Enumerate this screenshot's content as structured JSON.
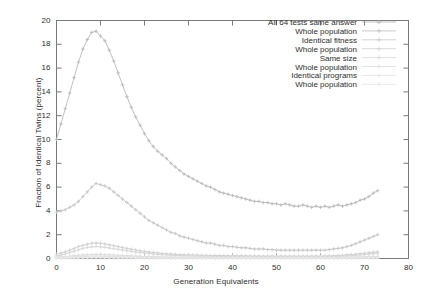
{
  "chart_data": {
    "type": "line",
    "title": "",
    "xlabel": "Generation Equivalents",
    "ylabel": "Fraction of Identical Twins (percent)",
    "xlim": [
      0,
      80
    ],
    "ylim": [
      0,
      20
    ],
    "xticks": [
      0,
      10,
      20,
      30,
      40,
      50,
      60,
      70,
      80
    ],
    "yticks": [
      0,
      2,
      4,
      6,
      8,
      10,
      12,
      14,
      16,
      18,
      20
    ],
    "grid": false,
    "legend_position": "top-right",
    "legend_entries": [
      "All 64 tests same answer",
      "Whole population",
      "Identical fitness",
      "Whole population",
      "Same size",
      "Whole population",
      "Identical programs",
      "Whole population"
    ],
    "marker": "plus-with-line",
    "series": [
      {
        "name": "All 64 tests same answer",
        "color": "#b9b9b9",
        "x": [
          0,
          1,
          2,
          3,
          4,
          5,
          6,
          7,
          8,
          9,
          10,
          11,
          12,
          13,
          14,
          15,
          16,
          17,
          18,
          19,
          20,
          21,
          22,
          23,
          24,
          25,
          26,
          27,
          28,
          29,
          30,
          31,
          32,
          33,
          34,
          35,
          36,
          37,
          38,
          39,
          40,
          41,
          42,
          43,
          44,
          45,
          46,
          47,
          48,
          49,
          50,
          51,
          52,
          53,
          54,
          55,
          56,
          57,
          58,
          59,
          60,
          61,
          62,
          63,
          64,
          65,
          66,
          67,
          68,
          69,
          70,
          71,
          72,
          73
        ],
        "values": [
          10.0,
          11.3,
          12.6,
          13.9,
          15.2,
          16.5,
          17.6,
          18.4,
          19.0,
          19.1,
          18.7,
          18.3,
          17.5,
          16.6,
          15.6,
          14.6,
          13.6,
          12.7,
          11.9,
          11.2,
          10.5,
          9.9,
          9.4,
          9.0,
          8.7,
          8.4,
          8.0,
          7.7,
          7.4,
          7.1,
          6.9,
          6.7,
          6.5,
          6.3,
          6.1,
          6.0,
          5.8,
          5.6,
          5.5,
          5.4,
          5.3,
          5.2,
          5.1,
          5.0,
          4.9,
          4.8,
          4.8,
          4.7,
          4.7,
          4.6,
          4.6,
          4.5,
          4.6,
          4.5,
          4.4,
          4.4,
          4.5,
          4.4,
          4.3,
          4.4,
          4.3,
          4.4,
          4.3,
          4.4,
          4.5,
          4.4,
          4.5,
          4.6,
          4.7,
          4.9,
          5.0,
          5.2,
          5.5,
          5.7
        ]
      },
      {
        "name": "Whole population",
        "color": "#c4c4c4",
        "x": [
          0,
          1,
          2,
          3,
          4,
          5,
          6,
          7,
          8,
          9,
          10,
          11,
          12,
          13,
          14,
          15,
          16,
          17,
          18,
          19,
          20,
          21,
          22,
          23,
          24,
          25,
          26,
          27,
          28,
          29,
          30,
          31,
          32,
          33,
          34,
          35,
          36,
          37,
          38,
          39,
          40,
          41,
          42,
          43,
          44,
          45,
          46,
          47,
          48,
          49,
          50,
          51,
          52,
          53,
          54,
          55,
          56,
          57,
          58,
          59,
          60,
          61,
          62,
          63,
          64,
          65,
          66,
          67,
          68,
          69,
          70,
          71,
          72,
          73
        ],
        "values": [
          3.9,
          4.0,
          4.1,
          4.3,
          4.5,
          4.8,
          5.2,
          5.6,
          6.0,
          6.3,
          6.2,
          6.1,
          5.9,
          5.6,
          5.3,
          5.0,
          4.7,
          4.4,
          4.1,
          3.8,
          3.5,
          3.2,
          3.0,
          2.8,
          2.6,
          2.4,
          2.2,
          2.1,
          1.9,
          1.8,
          1.7,
          1.6,
          1.5,
          1.4,
          1.3,
          1.3,
          1.2,
          1.1,
          1.1,
          1.0,
          1.0,
          0.95,
          0.9,
          0.9,
          0.85,
          0.8,
          0.8,
          0.8,
          0.75,
          0.75,
          0.7,
          0.7,
          0.7,
          0.7,
          0.7,
          0.7,
          0.7,
          0.7,
          0.7,
          0.7,
          0.7,
          0.7,
          0.75,
          0.8,
          0.85,
          0.9,
          1.0,
          1.1,
          1.25,
          1.4,
          1.55,
          1.7,
          1.85,
          2.0
        ]
      },
      {
        "name": "Identical fitness",
        "color": "#cfcfcf",
        "x": [
          0,
          1,
          2,
          3,
          4,
          5,
          6,
          7,
          8,
          9,
          10,
          11,
          12,
          13,
          14,
          15,
          16,
          17,
          18,
          19,
          20,
          21,
          22,
          23,
          24,
          25,
          26,
          27,
          28,
          29,
          30,
          31,
          32,
          33,
          34,
          35,
          36,
          37,
          38,
          39,
          40,
          41,
          42,
          43,
          44,
          45,
          46,
          47,
          48,
          49,
          50,
          51,
          52,
          53,
          54,
          55,
          56,
          57,
          58,
          59,
          60,
          61,
          62,
          63,
          64,
          65,
          66,
          67,
          68,
          69,
          70,
          71,
          72,
          73
        ],
        "values": [
          0.35,
          0.45,
          0.55,
          0.7,
          0.85,
          1.0,
          1.1,
          1.2,
          1.28,
          1.3,
          1.28,
          1.22,
          1.15,
          1.08,
          1.0,
          0.92,
          0.85,
          0.78,
          0.72,
          0.66,
          0.6,
          0.55,
          0.5,
          0.46,
          0.42,
          0.4,
          0.37,
          0.35,
          0.33,
          0.31,
          0.3,
          0.29,
          0.28,
          0.27,
          0.26,
          0.25,
          0.25,
          0.24,
          0.24,
          0.23,
          0.23,
          0.22,
          0.22,
          0.22,
          0.21,
          0.21,
          0.21,
          0.2,
          0.2,
          0.2,
          0.2,
          0.2,
          0.2,
          0.2,
          0.2,
          0.2,
          0.2,
          0.2,
          0.2,
          0.2,
          0.2,
          0.21,
          0.22,
          0.23,
          0.25,
          0.27,
          0.3,
          0.33,
          0.36,
          0.4,
          0.44,
          0.48,
          0.52,
          0.56
        ]
      },
      {
        "name": "Whole population",
        "color": "#d6d6d6",
        "x": [
          0,
          1,
          2,
          3,
          4,
          5,
          6,
          7,
          8,
          9,
          10,
          11,
          12,
          13,
          14,
          15,
          16,
          17,
          18,
          19,
          20,
          21,
          22,
          23,
          24,
          25,
          26,
          27,
          28,
          29,
          30,
          31,
          32,
          33,
          34,
          35,
          36,
          37,
          38,
          39,
          40,
          41,
          42,
          43,
          44,
          45,
          46,
          47,
          48,
          49,
          50,
          51,
          52,
          53,
          54,
          55,
          56,
          57,
          58,
          59,
          60,
          61,
          62,
          63,
          64,
          65,
          66,
          67,
          68,
          69,
          70,
          71,
          72,
          73
        ],
        "values": [
          0.2,
          0.28,
          0.38,
          0.5,
          0.62,
          0.74,
          0.85,
          0.93,
          0.98,
          1.0,
          0.98,
          0.94,
          0.89,
          0.83,
          0.77,
          0.71,
          0.65,
          0.6,
          0.55,
          0.5,
          0.46,
          0.42,
          0.38,
          0.35,
          0.32,
          0.3,
          0.28,
          0.26,
          0.25,
          0.23,
          0.22,
          0.21,
          0.2,
          0.2,
          0.19,
          0.18,
          0.18,
          0.17,
          0.17,
          0.17,
          0.16,
          0.16,
          0.16,
          0.15,
          0.15,
          0.15,
          0.15,
          0.15,
          0.14,
          0.14,
          0.14,
          0.14,
          0.14,
          0.14,
          0.14,
          0.14,
          0.14,
          0.14,
          0.14,
          0.14,
          0.15,
          0.15,
          0.16,
          0.17,
          0.18,
          0.2,
          0.22,
          0.24,
          0.27,
          0.3,
          0.33,
          0.36,
          0.4,
          0.43
        ]
      },
      {
        "name": "Same size",
        "color": "#dcdcdc",
        "x": [
          0,
          1,
          2,
          3,
          4,
          5,
          6,
          7,
          8,
          9,
          10,
          11,
          12,
          13,
          14,
          15,
          16,
          17,
          18,
          19,
          20,
          21,
          22,
          23,
          24,
          25,
          26,
          27,
          28,
          29,
          30,
          31,
          32,
          33,
          34,
          35,
          36,
          37,
          38,
          39,
          40,
          41,
          42,
          43,
          44,
          45,
          46,
          47,
          48,
          49,
          50,
          51,
          52,
          53,
          54,
          55,
          56,
          57,
          58,
          59,
          60,
          61,
          62,
          63,
          64,
          65,
          66,
          67,
          68,
          69,
          70,
          71,
          72,
          73
        ],
        "values": [
          0.1,
          0.13,
          0.16,
          0.2,
          0.24,
          0.27,
          0.3,
          0.32,
          0.34,
          0.35,
          0.34,
          0.33,
          0.31,
          0.29,
          0.27,
          0.25,
          0.23,
          0.22,
          0.2,
          0.19,
          0.17,
          0.16,
          0.15,
          0.14,
          0.13,
          0.13,
          0.12,
          0.12,
          0.11,
          0.11,
          0.1,
          0.1,
          0.1,
          0.1,
          0.09,
          0.09,
          0.09,
          0.09,
          0.09,
          0.08,
          0.08,
          0.08,
          0.08,
          0.08,
          0.08,
          0.08,
          0.08,
          0.08,
          0.08,
          0.08,
          0.08,
          0.08,
          0.08,
          0.08,
          0.08,
          0.08,
          0.08,
          0.08,
          0.08,
          0.08,
          0.08,
          0.08,
          0.08,
          0.09,
          0.09,
          0.1,
          0.11,
          0.12,
          0.13,
          0.14,
          0.15,
          0.16,
          0.17,
          0.18
        ]
      },
      {
        "name": "Whole population",
        "color": "#e0e0e0",
        "x": [
          0,
          1,
          2,
          3,
          4,
          5,
          6,
          7,
          8,
          9,
          10,
          11,
          12,
          13,
          14,
          15,
          16,
          17,
          18,
          19,
          20,
          21,
          22,
          23,
          24,
          25,
          26,
          27,
          28,
          29,
          30,
          31,
          32,
          33,
          34,
          35,
          36,
          37,
          38,
          39,
          40,
          41,
          42,
          43,
          44,
          45,
          46,
          47,
          48,
          49,
          50,
          51,
          52,
          53,
          54,
          55,
          56,
          57,
          58,
          59,
          60,
          61,
          62,
          63,
          64,
          65,
          66,
          67,
          68,
          69,
          70,
          71,
          72,
          73
        ],
        "values": [
          0.06,
          0.08,
          0.1,
          0.12,
          0.14,
          0.16,
          0.18,
          0.19,
          0.2,
          0.21,
          0.2,
          0.19,
          0.18,
          0.17,
          0.16,
          0.15,
          0.14,
          0.13,
          0.12,
          0.11,
          0.1,
          0.1,
          0.09,
          0.09,
          0.08,
          0.08,
          0.08,
          0.07,
          0.07,
          0.07,
          0.07,
          0.06,
          0.06,
          0.06,
          0.06,
          0.06,
          0.06,
          0.06,
          0.06,
          0.05,
          0.05,
          0.05,
          0.05,
          0.05,
          0.05,
          0.05,
          0.05,
          0.05,
          0.05,
          0.05,
          0.05,
          0.05,
          0.05,
          0.05,
          0.05,
          0.05,
          0.05,
          0.05,
          0.05,
          0.05,
          0.05,
          0.05,
          0.05,
          0.06,
          0.06,
          0.06,
          0.07,
          0.07,
          0.08,
          0.08,
          0.09,
          0.1,
          0.1,
          0.11
        ]
      },
      {
        "name": "Identical programs",
        "color": "#e4e4e4",
        "x": [
          0,
          1,
          2,
          3,
          4,
          5,
          6,
          7,
          8,
          9,
          10,
          11,
          12,
          13,
          14,
          15,
          16,
          17,
          18,
          19,
          20,
          21,
          22,
          23,
          24,
          25,
          26,
          27,
          28,
          29,
          30,
          31,
          32,
          33,
          34,
          35,
          36,
          37,
          38,
          39,
          40,
          41,
          42,
          43,
          44,
          45,
          46,
          47,
          48,
          49,
          50,
          51,
          52,
          53,
          54,
          55,
          56,
          57,
          58,
          59,
          60,
          61,
          62,
          63,
          64,
          65,
          66,
          67,
          68,
          69,
          70,
          71,
          72,
          73
        ],
        "values": [
          0.03,
          0.04,
          0.05,
          0.06,
          0.07,
          0.08,
          0.09,
          0.1,
          0.11,
          0.11,
          0.11,
          0.1,
          0.1,
          0.09,
          0.09,
          0.08,
          0.08,
          0.07,
          0.07,
          0.06,
          0.06,
          0.05,
          0.05,
          0.05,
          0.05,
          0.04,
          0.04,
          0.04,
          0.04,
          0.04,
          0.04,
          0.04,
          0.03,
          0.03,
          0.03,
          0.03,
          0.03,
          0.03,
          0.03,
          0.03,
          0.03,
          0.03,
          0.03,
          0.03,
          0.03,
          0.03,
          0.03,
          0.03,
          0.03,
          0.03,
          0.03,
          0.03,
          0.03,
          0.03,
          0.03,
          0.03,
          0.03,
          0.03,
          0.03,
          0.03,
          0.03,
          0.03,
          0.03,
          0.03,
          0.03,
          0.04,
          0.04,
          0.04,
          0.04,
          0.05,
          0.05,
          0.05,
          0.06,
          0.06
        ]
      },
      {
        "name": "Whole population",
        "color": "#e8e8e8",
        "x": [
          0,
          1,
          2,
          3,
          4,
          5,
          6,
          7,
          8,
          9,
          10,
          11,
          12,
          13,
          14,
          15,
          16,
          17,
          18,
          19,
          20,
          21,
          22,
          23,
          24,
          25,
          26,
          27,
          28,
          29,
          30,
          31,
          32,
          33,
          34,
          35,
          36,
          37,
          38,
          39,
          40,
          41,
          42,
          43,
          44,
          45,
          46,
          47,
          48,
          49,
          50,
          51,
          52,
          53,
          54,
          55,
          56,
          57,
          58,
          59,
          60,
          61,
          62,
          63,
          64,
          65,
          66,
          67,
          68,
          69,
          70,
          71,
          72,
          73
        ],
        "values": [
          0.02,
          0.02,
          0.03,
          0.03,
          0.04,
          0.04,
          0.05,
          0.05,
          0.06,
          0.06,
          0.06,
          0.05,
          0.05,
          0.05,
          0.04,
          0.04,
          0.04,
          0.04,
          0.03,
          0.03,
          0.03,
          0.03,
          0.03,
          0.02,
          0.02,
          0.02,
          0.02,
          0.02,
          0.02,
          0.02,
          0.02,
          0.02,
          0.02,
          0.02,
          0.02,
          0.02,
          0.02,
          0.02,
          0.02,
          0.02,
          0.02,
          0.02,
          0.02,
          0.02,
          0.02,
          0.02,
          0.02,
          0.02,
          0.02,
          0.02,
          0.02,
          0.02,
          0.02,
          0.02,
          0.02,
          0.02,
          0.02,
          0.02,
          0.02,
          0.02,
          0.02,
          0.02,
          0.02,
          0.02,
          0.02,
          0.02,
          0.02,
          0.02,
          0.02,
          0.02,
          0.03,
          0.03,
          0.03,
          0.03
        ]
      }
    ]
  },
  "axis": {
    "frame_color": "#7a7a7a"
  }
}
